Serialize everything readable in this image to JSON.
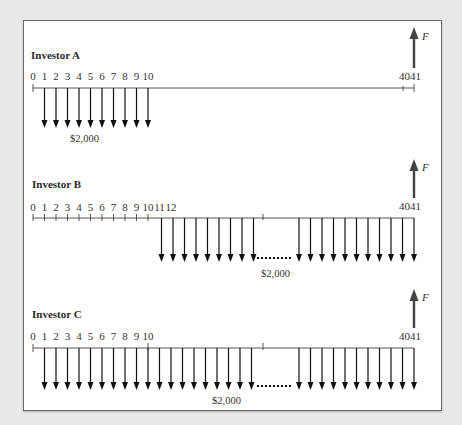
{
  "figure": {
    "panels": [
      {
        "title": "Investor A",
        "tick_labels": [
          "0",
          "1",
          "2",
          "3",
          "4",
          "5",
          "6",
          "7",
          "8",
          "9",
          "10"
        ],
        "end_label": "4041",
        "deposit_periods": "1-10",
        "amount_label": "$2,000",
        "future_value_label": "F"
      },
      {
        "title": "Investor B",
        "tick_labels": [
          "0",
          "1",
          "2",
          "3",
          "4",
          "5",
          "6",
          "7",
          "8",
          "9",
          "10",
          "11",
          "12"
        ],
        "end_label": "4041",
        "deposit_periods": "11-41",
        "amount_label": "$2,000",
        "future_value_label": "F"
      },
      {
        "title": "Investor C",
        "tick_labels": [
          "0",
          "1",
          "2",
          "3",
          "4",
          "5",
          "6",
          "7",
          "8",
          "9",
          "10"
        ],
        "end_label": "4041",
        "deposit_periods": "1-41",
        "amount_label": "$2,000",
        "future_value_label": "F"
      }
    ],
    "colors": {
      "frame_bg": "#ffffff",
      "page_bg": "#e9e9e8",
      "line": "#222222",
      "f_arrow": "#444444"
    }
  }
}
